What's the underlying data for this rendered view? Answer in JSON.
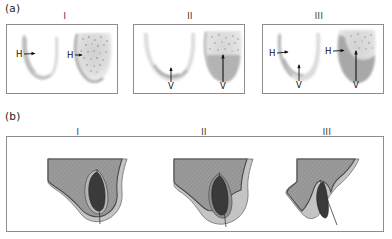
{
  "figure": {
    "panels": [
      {
        "tag": "(a)",
        "description": "radiographic / CT cross-sectional scans of mandibular bone",
        "columns": [
          {
            "roman": "I",
            "markers": [
              "H",
              "H"
            ]
          },
          {
            "roman": "II",
            "markers": [
              "V",
              "V"
            ]
          },
          {
            "roman": "III",
            "markers": [
              "H",
              "V",
              "H",
              "V"
            ]
          }
        ]
      },
      {
        "tag": "(b)",
        "description": "schematic line drawings of bone cross-section with implant",
        "columns": [
          {
            "roman": "I"
          },
          {
            "roman": "II"
          },
          {
            "roman": "III"
          }
        ]
      }
    ],
    "markers": {
      "horizontal": "H",
      "vertical": "V"
    },
    "colors": {
      "frame_stroke": "#8c8c8c",
      "bone_fill": "#9a9a9a",
      "bone_stroke": "#555555",
      "soft_tissue_fill": "#c8c8c8",
      "implant_fill": "#3c3c3c",
      "scan_light": "#dcdcdc",
      "scan_mid": "#b4b4b4",
      "scan_dark": "#8f8f8f",
      "text": "#1a1a1a",
      "background": "#ffffff"
    }
  }
}
